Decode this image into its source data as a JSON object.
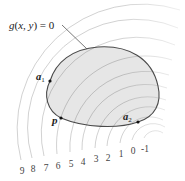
{
  "figure": {
    "type": "contour-with-feasible-region",
    "constraint_label": {
      "text": "g(x, y) = 0",
      "parts": [
        "g",
        "(",
        "x",
        ", ",
        "y",
        ") = 0"
      ]
    },
    "points": {
      "a1": {
        "base": "a",
        "sub": "1"
      },
      "a2": {
        "base": "a",
        "sub": "2"
      },
      "p": {
        "base": "p"
      }
    },
    "contour_levels": [
      "9",
      "8",
      "7",
      "6",
      "5",
      "4",
      "3",
      "2",
      "1",
      "0",
      "-1"
    ],
    "colors": {
      "region_fill": "#e6e6e6",
      "region_outline": "#4a4a4a",
      "contour_line": "#c8c8c8",
      "point": "#111111",
      "text": "#222222"
    }
  }
}
